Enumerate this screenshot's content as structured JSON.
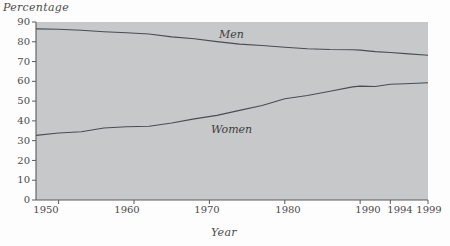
{
  "figure": {
    "background_color": "#fdfdfd",
    "plot_fill_color": "#c6c8ca",
    "line_color": "#4a4d50",
    "axis_color": "#5a5a5a"
  },
  "chart_data": {
    "type": "line",
    "title": "",
    "xlabel": "Year",
    "ylabel": "Percentage",
    "xlim": [
      1947,
      1999
    ],
    "ylim": [
      0,
      90
    ],
    "grid": false,
    "legend": "inline-labels",
    "x_tick_labels": [
      "1950",
      "1960",
      "1970",
      "1980",
      "1990",
      "1994",
      "1999"
    ],
    "x_tick_values": [
      1950,
      1960,
      1970,
      1980,
      1990,
      1994,
      1999
    ],
    "y_tick_labels": [
      "0",
      "10",
      "20",
      "30",
      "40",
      "50",
      "60",
      "70",
      "80",
      "90"
    ],
    "y_tick_values": [
      0,
      10,
      20,
      30,
      40,
      50,
      60,
      70,
      80,
      90
    ],
    "series": [
      {
        "name": "Men",
        "label": "Men",
        "x": [
          1947,
          1950,
          1953,
          1956,
          1959,
          1962,
          1965,
          1968,
          1971,
          1974,
          1977,
          1980,
          1983,
          1986,
          1989,
          1990,
          1992,
          1994,
          1996,
          1999
        ],
        "values": [
          86.5,
          86.3,
          85.8,
          85.1,
          84.6,
          83.9,
          82.5,
          81.5,
          80.1,
          78.8,
          78.1,
          77.2,
          76.5,
          76.1,
          76.0,
          75.8,
          75.0,
          74.6,
          74.0,
          73.2
        ]
      },
      {
        "name": "Women",
        "label": "Women",
        "x": [
          1947,
          1950,
          1953,
          1956,
          1959,
          1962,
          1965,
          1968,
          1971,
          1974,
          1977,
          1980,
          1983,
          1986,
          1989,
          1990,
          1992,
          1994,
          1996,
          1999
        ],
        "values": [
          32.7,
          33.9,
          34.5,
          36.4,
          37.0,
          37.3,
          38.9,
          41.0,
          42.8,
          45.3,
          47.8,
          51.2,
          52.8,
          55.0,
          57.2,
          57.6,
          57.4,
          58.5,
          58.8,
          59.3
        ]
      }
    ]
  },
  "labels": {
    "percentage": "Percentage",
    "year": "Year",
    "men": "Men",
    "women": "Women",
    "y0": "0",
    "y10": "10",
    "y20": "20",
    "y30": "30",
    "y40": "40",
    "y50": "50",
    "y60": "60",
    "y70": "70",
    "y80": "80",
    "y90": "90",
    "x1950": "1950",
    "x1960": "1960",
    "x1970": "1970",
    "x1980": "1980",
    "x1990": "1990",
    "x1994": "1994",
    "x1999": "1999"
  }
}
